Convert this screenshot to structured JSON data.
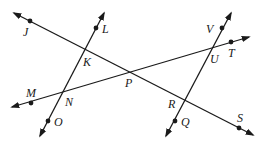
{
  "diagram": {
    "type": "geometry-intersecting-lines",
    "colors": {
      "ink": "#1a1a1a",
      "background": "#ffffff"
    },
    "lines": [
      {
        "name": "JS",
        "through": [
          "J",
          "K",
          "P",
          "R",
          "S"
        ]
      },
      {
        "name": "MT",
        "through": [
          "M",
          "N",
          "P",
          "U",
          "T"
        ]
      },
      {
        "name": "LO",
        "through": [
          "L",
          "K",
          "N",
          "O"
        ]
      },
      {
        "name": "VQ",
        "through": [
          "V",
          "U",
          "R",
          "Q"
        ]
      }
    ],
    "labels": {
      "J": "J",
      "K": "K",
      "L": "L",
      "M": "M",
      "N": "N",
      "O": "O",
      "P": "P",
      "Q": "Q",
      "R": "R",
      "S": "S",
      "T": "T",
      "U": "U",
      "V": "V"
    },
    "marked_points": [
      "J",
      "L",
      "M",
      "O",
      "Q",
      "S",
      "T",
      "V"
    ],
    "intersections": [
      "K",
      "N",
      "P",
      "R",
      "U"
    ]
  }
}
